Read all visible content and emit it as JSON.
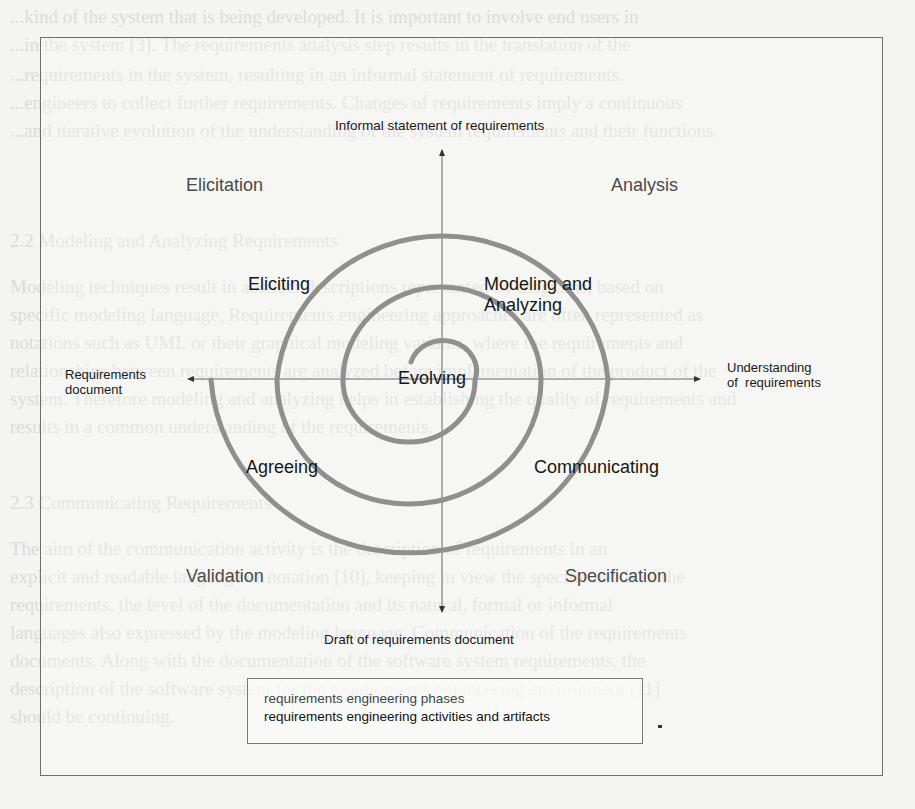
{
  "figure": {
    "top_label": "Informal statement of requirements",
    "bottom_label": "Draft of requirements document",
    "left_label": [
      "Requirements",
      "document"
    ],
    "right_label": [
      "Understanding",
      "of  requirements"
    ],
    "phases": {
      "top_left": "Elicitation",
      "top_right": "Analysis",
      "bottom_left": "Validation",
      "bottom_right": "Specification"
    },
    "activities": {
      "eliciting": "Eliciting",
      "modeling": [
        "Modeling and",
        "Analyzing"
      ],
      "evolving": "Evolving",
      "agreeing": "Agreeing",
      "communicating": "Communicating"
    },
    "legend": {
      "phases": "requirements engineering phases",
      "activities": "requirements engineering activities and artifacts"
    },
    "colors": {
      "spiral": "#8f8f8f",
      "axis": "#555555",
      "frame": "#6e6e6e",
      "phase_text": "#4a4a4a",
      "activity_text": "#161616"
    }
  },
  "background_text": [
    "...kind of the system that is being developed. It is important to involve end users in",
    "...in the system [3]. The requirements analysis step results in the translation of the",
    "...requirements in the system, resulting in an informal statement of requirements.",
    "...engineers to collect further requirements. Changes of requirements imply a continuous",
    "...and iterative evolution of the understanding of the system requirements and their functions.",
    "2.2  Modeling and Analyzing Requirements",
    "Modeling techniques result in abstract descriptions represented by diagrams, based on",
    "specific modeling language, Requirements engineering approaches are often represented as",
    "notations such as UML or their graphical modeling variants, where the requirements and",
    "relationships between requirements are analyzed before implementation of the product of the",
    "system. Therefore modeling and analyzing helps in establishing the quality of requirements and",
    "results in a common understanding of the requirements.",
    "2.3  Communicating Requirements",
    "The aim of the communication activity is the description of requirements in an",
    "explicit and readable language or notation [10], keeping in view the specific needs of the",
    "requirements, the level of the documentation and its natural, formal or informal",
    "languages also expressed by the modeling language. Communication of the requirements",
    "documents. Along with the documentation of the software system requirements, the",
    "description of the software system for the requirements engineering environment [11]",
    "should be continuing."
  ]
}
